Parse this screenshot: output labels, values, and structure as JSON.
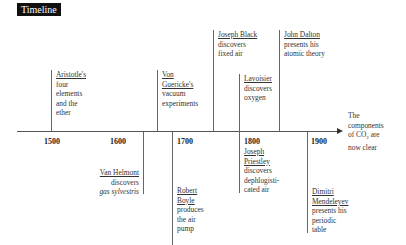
{
  "title": "Timeline",
  "axis": {
    "years": [
      "1500",
      "1600",
      "1700",
      "1800",
      "1900"
    ],
    "end_note": {
      "line1": "The",
      "line2": "components",
      "line3_prefix": "of CO",
      "line3_sub": "2",
      "line3_suffix": " are",
      "line4": "now clear"
    }
  },
  "events_above": [
    {
      "name": "Aristotle's",
      "desc": [
        "four",
        "elements",
        "and the",
        "ether"
      ]
    },
    {
      "name_lines": [
        "Von",
        "Guericke's"
      ],
      "desc": [
        "vacuum",
        "experiments"
      ]
    },
    {
      "name": "Joseph Black",
      "desc": [
        "discovers",
        "fixed air"
      ]
    },
    {
      "name": "Lavoisier",
      "desc": [
        "discovers",
        "oxygen"
      ]
    },
    {
      "name": "John Dalton",
      "desc": [
        "presents his",
        "atomic theory"
      ]
    }
  ],
  "events_below": [
    {
      "name": "Van Helmont",
      "desc": [
        "discovers"
      ],
      "desc_italic": "gas sylvestris"
    },
    {
      "name_lines": [
        "Robert",
        "Boyle"
      ],
      "desc": [
        "produces",
        "the air",
        "pump"
      ]
    },
    {
      "name_lines": [
        "Joseph",
        "Priestley"
      ],
      "desc": [
        "discovers",
        "dephlogisti-",
        "cated air"
      ]
    },
    {
      "name_lines": [
        "Dimitri",
        "Mendeleyev"
      ],
      "desc": [
        "presents his",
        "periodic",
        "table"
      ]
    }
  ]
}
